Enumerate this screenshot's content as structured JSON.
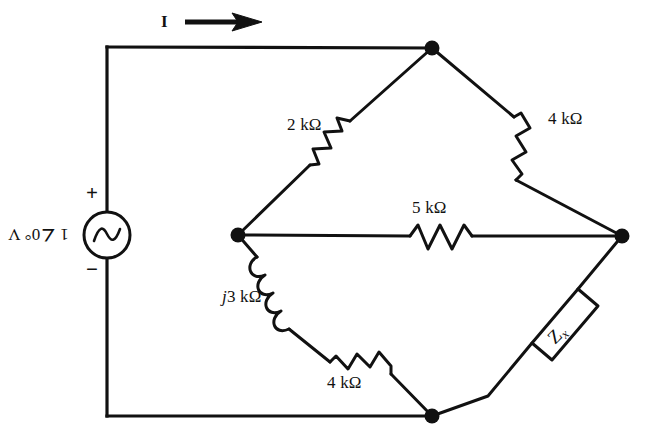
{
  "figure": {
    "type": "circuit-diagram",
    "background_color": "#ffffff",
    "ink_color": "#111111"
  },
  "source": {
    "kind": "ac-voltage-source",
    "label": "1 ∠0° V",
    "label_rotated_180": true,
    "plus_sign": "+",
    "minus_sign": "−"
  },
  "current": {
    "label": "I",
    "direction": "right"
  },
  "nodes": [
    {
      "name": "top",
      "x": 432,
      "y": 48
    },
    {
      "name": "left",
      "x": 238,
      "y": 235
    },
    {
      "name": "right",
      "x": 622,
      "y": 236
    },
    {
      "name": "bottom",
      "x": 432,
      "y": 416
    }
  ],
  "components": [
    {
      "name": "r-2k",
      "kind": "resistor",
      "label": "2 kΩ",
      "between": [
        "left",
        "top"
      ],
      "label_x": 287,
      "label_y": 116
    },
    {
      "name": "r-4k-top",
      "kind": "resistor",
      "label": "4 kΩ",
      "between": [
        "top",
        "right"
      ],
      "label_x": 548,
      "label_y": 110
    },
    {
      "name": "r-5k",
      "kind": "resistor",
      "label": "5 kΩ",
      "between": [
        "left",
        "right"
      ],
      "label_x": 412,
      "label_y": 199
    },
    {
      "name": "l-j3k",
      "kind": "inductor",
      "label": "j3 kΩ",
      "label_italic_prefix": "j",
      "label_rest": "3 kΩ",
      "between": [
        "left",
        "bottom"
      ],
      "label_x": 222,
      "label_y": 288
    },
    {
      "name": "r-4k-bottom",
      "kind": "resistor",
      "label": "4 kΩ",
      "between": [
        "bottom",
        "left"
      ],
      "label_x": 327,
      "label_y": 374
    },
    {
      "name": "z-x",
      "kind": "impedance-box",
      "label_main": "Z",
      "label_sub": "x",
      "between": [
        "right",
        "bottom"
      ],
      "label_x": 549,
      "label_y": 324
    }
  ]
}
